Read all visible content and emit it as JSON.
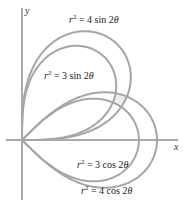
{
  "chart_data": {
    "type": "line",
    "title": "",
    "xlabel": "x",
    "ylabel": "y",
    "origin_px": [
      22,
      140
    ],
    "scale_px_per_unit": 67.5,
    "series": [
      {
        "name": "r^2 = 4 sin 2θ",
        "a2": 4,
        "fn": "sin"
      },
      {
        "name": "r^2 = 3 sin 2θ",
        "a2": 3,
        "fn": "sin"
      },
      {
        "name": "r^2 = 3 cos 2θ",
        "a2": 3,
        "fn": "cos"
      },
      {
        "name": "r^2 = 4 cos 2θ",
        "a2": 4,
        "fn": "cos"
      }
    ],
    "grid": false,
    "legend": "inline labels"
  },
  "axes": {
    "x_label": "x",
    "y_label": "y"
  },
  "colors": {
    "curve": "#a6a6a6",
    "axis": "#555555",
    "shade": "#ececec"
  },
  "labels": {
    "l4sin": {
      "lhs": "r",
      "exp": "2",
      "rhs": " = 4 sin 2",
      "theta": "θ"
    },
    "l3sin": {
      "lhs": "r",
      "exp": "2",
      "rhs": " = 3 sin 2",
      "theta": "θ"
    },
    "l3cos": {
      "lhs": "r",
      "exp": "2",
      "rhs": " = 3 cos 2",
      "theta": "θ"
    },
    "l4cos": {
      "lhs": "r",
      "exp": "2",
      "rhs": " = 4 cos 2",
      "theta": "θ"
    }
  }
}
